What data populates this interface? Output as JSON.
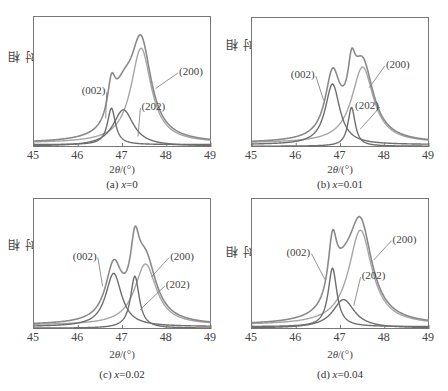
{
  "chart_data": [
    {
      "type": "line",
      "panel": "a",
      "caption": "(a) x=0",
      "xlabel": "2θ/(°)",
      "ylabel": "相对强度",
      "xlim": [
        45,
        49
      ],
      "xticks": [
        "45",
        "46",
        "47",
        "48",
        "49"
      ],
      "grid": false,
      "series": [
        {
          "name": "sum",
          "color": "#8a8a8a"
        },
        {
          "name": "(200)",
          "center": 47.42,
          "height": 0.73,
          "width": 0.28,
          "color": "#a6a6a6"
        },
        {
          "name": "(002)",
          "center": 46.75,
          "height": 0.28,
          "width": 0.11,
          "color": "#6e6e6e"
        },
        {
          "name": "(202)",
          "center": 47.02,
          "height": 0.28,
          "width": 0.28,
          "color": "#6e6e6e"
        }
      ],
      "baseline": 0.03,
      "annotations": [
        {
          "text": "(002)",
          "x": 46.1,
          "y": 0.42,
          "arrow_to": [
            46.62,
            0.22
          ]
        },
        {
          "text": "(202)",
          "x": 47.45,
          "y": 0.3,
          "arrow_to": [
            47.35,
            0.08
          ]
        },
        {
          "text": "(200)",
          "x": 48.3,
          "y": 0.57,
          "arrow_to": [
            47.75,
            0.45
          ]
        }
      ]
    },
    {
      "type": "line",
      "panel": "b",
      "caption": "(b) x=0.01",
      "xlabel": "2θ/(°)",
      "ylabel": "相对强度",
      "xlim": [
        45,
        49
      ],
      "xticks": [
        "45",
        "46",
        "47",
        "48",
        "49"
      ],
      "grid": false,
      "series": [
        {
          "name": "sum",
          "color": "#8a8a8a"
        },
        {
          "name": "(200)",
          "center": 47.5,
          "height": 0.59,
          "width": 0.3,
          "color": "#a6a6a6"
        },
        {
          "name": "(002)",
          "center": 46.82,
          "height": 0.47,
          "width": 0.2,
          "color": "#6e6e6e"
        },
        {
          "name": "(202)",
          "center": 47.25,
          "height": 0.3,
          "width": 0.1,
          "color": "#6e6e6e"
        }
      ],
      "baseline": 0.03,
      "annotations": [
        {
          "text": "(002)",
          "x": 45.9,
          "y": 0.55,
          "arrow_to": [
            46.62,
            0.36
          ]
        },
        {
          "text": "(202)",
          "x": 47.35,
          "y": 0.31,
          "arrow_to": [
            47.45,
            0.14
          ]
        },
        {
          "text": "(200)",
          "x": 48.05,
          "y": 0.63,
          "arrow_to": [
            47.65,
            0.46
          ]
        }
      ]
    },
    {
      "type": "line",
      "panel": "c",
      "caption": "(c) x=0.02",
      "xlabel": "2θ/(°)",
      "ylabel": "相对强度",
      "xlim": [
        45,
        49
      ],
      "xticks": [
        "45",
        "46",
        "47",
        "48",
        "49"
      ],
      "grid": false,
      "series": [
        {
          "name": "sum",
          "color": "#8a8a8a"
        },
        {
          "name": "(200)",
          "center": 47.52,
          "height": 0.47,
          "width": 0.3,
          "color": "#a6a6a6"
        },
        {
          "name": "(002)",
          "center": 46.8,
          "height": 0.41,
          "width": 0.22,
          "color": "#6e6e6e"
        },
        {
          "name": "(202)",
          "center": 47.28,
          "height": 0.4,
          "width": 0.12,
          "color": "#6e6e6e"
        }
      ],
      "baseline": 0.03,
      "annotations": [
        {
          "text": "(002)",
          "x": 45.9,
          "y": 0.55,
          "arrow_to": [
            46.55,
            0.33
          ]
        },
        {
          "text": "(202)",
          "x": 48.0,
          "y": 0.33,
          "arrow_to": [
            47.4,
            0.15
          ]
        },
        {
          "text": "(200)",
          "x": 48.1,
          "y": 0.55,
          "arrow_to": [
            47.65,
            0.4
          ]
        }
      ]
    },
    {
      "type": "line",
      "panel": "d",
      "caption": "(d) x=0.04",
      "xlabel": "2θ/(°)",
      "ylabel": "相对强度",
      "xlim": [
        45,
        49
      ],
      "xticks": [
        "45",
        "46",
        "47",
        "48",
        "49"
      ],
      "grid": false,
      "series": [
        {
          "name": "sum",
          "color": "#8a8a8a"
        },
        {
          "name": "(200)",
          "center": 47.45,
          "height": 0.73,
          "width": 0.32,
          "color": "#a6a6a6"
        },
        {
          "name": "(002)",
          "center": 46.82,
          "height": 0.45,
          "width": 0.12,
          "color": "#6e6e6e"
        },
        {
          "name": "(202)",
          "center": 47.07,
          "height": 0.22,
          "width": 0.3,
          "color": "#6e6e6e"
        }
      ],
      "baseline": 0.03,
      "annotations": [
        {
          "text": "(002)",
          "x": 45.8,
          "y": 0.58,
          "arrow_to": [
            46.65,
            0.38
          ]
        },
        {
          "text": "(202)",
          "x": 47.5,
          "y": 0.4,
          "arrow_to": [
            47.3,
            0.18
          ]
        },
        {
          "text": "(200)",
          "x": 48.2,
          "y": 0.68,
          "arrow_to": [
            47.75,
            0.53
          ]
        }
      ]
    }
  ],
  "panels": [
    {
      "caption": "(a) x=0",
      "caption_prefix": "(a) ",
      "caption_var": "x",
      "caption_val": "=0",
      "xlabel_prefix": "2",
      "xlabel_theta": "θ",
      "xlabel_suffix": "/(°)",
      "ylabel": "相对强度"
    },
    {
      "caption": "(b) x=0.01",
      "caption_prefix": "(b) ",
      "caption_var": "x",
      "caption_val": "=0.01",
      "xlabel_prefix": "2",
      "xlabel_theta": "θ",
      "xlabel_suffix": "/(°)",
      "ylabel": "相对强度"
    },
    {
      "caption": "(c) x=0.02",
      "caption_prefix": "(c) ",
      "caption_var": "x",
      "caption_val": "=0.02",
      "xlabel_prefix": "2",
      "xlabel_theta": "θ",
      "xlabel_suffix": "/(°)",
      "ylabel": "相对强度"
    },
    {
      "caption": "(d) x=0.04",
      "caption_prefix": "(d) ",
      "caption_var": "x",
      "caption_val": "=0.04",
      "xlabel_prefix": "2",
      "xlabel_theta": "θ",
      "xlabel_suffix": "/(°)",
      "ylabel": "相对强度"
    }
  ],
  "ticks": [
    "45",
    "46",
    "47",
    "48",
    "49"
  ]
}
